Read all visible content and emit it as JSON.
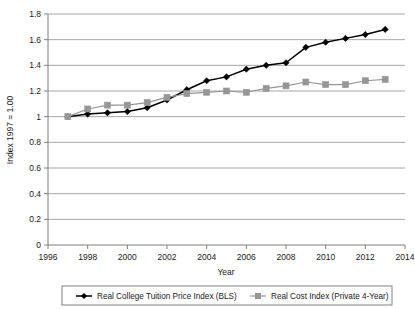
{
  "chart_data": {
    "type": "line",
    "title": "",
    "xlabel": "Year",
    "ylabel": "Index 1997 = 1.00",
    "xlim": [
      1996,
      2014
    ],
    "ylim": [
      0,
      1.8
    ],
    "grid": true,
    "grid_axis": "y",
    "legend_position": "bottom",
    "x_ticks": [
      "1996",
      "1998",
      "2000",
      "2002",
      "2004",
      "2006",
      "2008",
      "2010",
      "2012",
      "2014"
    ],
    "x_tick_values": [
      1996,
      1998,
      2000,
      2002,
      2004,
      2006,
      2008,
      2010,
      2012,
      2014
    ],
    "y_ticks": [
      "0",
      "0.2",
      "0.4",
      "0.6",
      "0.8",
      "1",
      "1.2",
      "1.4",
      "1.6",
      "1.8"
    ],
    "y_tick_values": [
      0,
      0.2,
      0.4,
      0.6,
      0.8,
      1.0,
      1.2,
      1.4,
      1.6,
      1.8
    ],
    "x": [
      1997,
      1998,
      1999,
      2000,
      2001,
      2002,
      2003,
      2004,
      2005,
      2006,
      2007,
      2008,
      2009,
      2010,
      2011,
      2012,
      2013
    ],
    "series": [
      {
        "name": "Real College Tuition Price Index (BLS)",
        "color": "#000000",
        "marker": "diamond",
        "values": [
          1.0,
          1.02,
          1.03,
          1.04,
          1.07,
          1.13,
          1.21,
          1.28,
          1.31,
          1.37,
          1.4,
          1.42,
          1.54,
          1.58,
          1.61,
          1.64,
          1.68
        ]
      },
      {
        "name": "Real Cost Index (Private 4-Year)",
        "color": "#969696",
        "marker": "square",
        "values": [
          1.0,
          1.06,
          1.09,
          1.09,
          1.11,
          1.15,
          1.18,
          1.19,
          1.2,
          1.19,
          1.22,
          1.24,
          1.27,
          1.25,
          1.25,
          1.28,
          1.29
        ]
      }
    ]
  },
  "legend": {
    "entries": [
      {
        "label": "Real College Tuition Price Index (BLS)"
      },
      {
        "label": "Real Cost Index (Private 4-Year)"
      }
    ]
  },
  "axes": {
    "x_title": "Year",
    "y_title": "Index 1997 = 1.00"
  },
  "colors": {
    "series_1": "#000000",
    "series_2": "#969696",
    "grid": "#a6a6a6",
    "axis": "#7f7f7f",
    "background": "#ffffff",
    "text": "#1a1a1a"
  }
}
